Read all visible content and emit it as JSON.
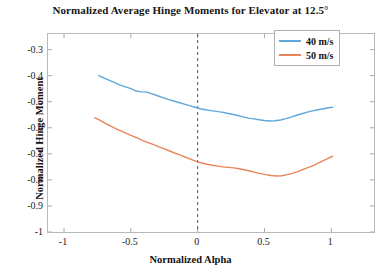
{
  "chart_data": {
    "type": "line",
    "title": "Normalized Average Hinge Moments for Elevator at 12.5°",
    "xlabel": "Normalized Alpha",
    "ylabel": "Normalized Hinge Moment",
    "xlim": [
      -1.12,
      1.32
    ],
    "ylim": [
      -1.0,
      -0.24
    ],
    "xticks": [
      -1,
      -0.5,
      0,
      0.5,
      1
    ],
    "xtick_labels": [
      "-1",
      "-0.5",
      "0",
      "0.5",
      "1"
    ],
    "yticks": [
      -0.3,
      -0.4,
      -0.5,
      -0.6,
      -0.7,
      -0.8,
      -0.9,
      -1
    ],
    "ytick_labels": [
      "-0.3",
      "-0.4",
      "-0.5",
      "-0.6",
      "-0.7",
      "-0.8",
      "-0.9",
      "-1"
    ],
    "grid": false,
    "legend_position": "top-right",
    "annotations": [
      {
        "type": "vline",
        "x": 0,
        "style": "dashed",
        "color": "#555555"
      }
    ],
    "series": [
      {
        "name": "40 m/s",
        "color": "#5fa8db",
        "x": [
          -0.74,
          -0.7,
          -0.66,
          -0.62,
          -0.58,
          -0.54,
          -0.5,
          -0.46,
          -0.42,
          -0.38,
          -0.34,
          -0.3,
          -0.26,
          -0.22,
          -0.18,
          -0.14,
          -0.1,
          -0.06,
          -0.02,
          0.02,
          0.06,
          0.1,
          0.14,
          0.18,
          0.22,
          0.26,
          0.3,
          0.34,
          0.38,
          0.42,
          0.46,
          0.5,
          0.54,
          0.58,
          0.62,
          0.66,
          0.7,
          0.74,
          0.78,
          0.82,
          0.86,
          0.9,
          0.94,
          0.98,
          1.01
        ],
        "y": [
          -0.4,
          -0.409,
          -0.418,
          -0.427,
          -0.436,
          -0.443,
          -0.45,
          -0.459,
          -0.462,
          -0.463,
          -0.47,
          -0.477,
          -0.484,
          -0.491,
          -0.497,
          -0.503,
          -0.509,
          -0.515,
          -0.521,
          -0.527,
          -0.531,
          -0.534,
          -0.537,
          -0.54,
          -0.544,
          -0.548,
          -0.553,
          -0.558,
          -0.563,
          -0.566,
          -0.569,
          -0.572,
          -0.574,
          -0.573,
          -0.57,
          -0.565,
          -0.559,
          -0.552,
          -0.546,
          -0.54,
          -0.535,
          -0.531,
          -0.527,
          -0.523,
          -0.521
        ]
      },
      {
        "name": "50 m/s",
        "color": "#e8855a",
        "x": [
          -0.77,
          -0.73,
          -0.69,
          -0.65,
          -0.61,
          -0.57,
          -0.53,
          -0.49,
          -0.45,
          -0.41,
          -0.37,
          -0.33,
          -0.29,
          -0.25,
          -0.21,
          -0.17,
          -0.13,
          -0.09,
          -0.05,
          -0.01,
          0.03,
          0.07,
          0.11,
          0.15,
          0.19,
          0.23,
          0.27,
          0.31,
          0.35,
          0.39,
          0.43,
          0.47,
          0.51,
          0.55,
          0.59,
          0.63,
          0.67,
          0.71,
          0.75,
          0.79,
          0.83,
          0.87,
          0.91,
          0.95,
          0.99,
          1.01
        ],
        "y": [
          -0.561,
          -0.572,
          -0.583,
          -0.594,
          -0.604,
          -0.613,
          -0.622,
          -0.631,
          -0.64,
          -0.649,
          -0.657,
          -0.665,
          -0.673,
          -0.681,
          -0.689,
          -0.697,
          -0.705,
          -0.713,
          -0.721,
          -0.729,
          -0.735,
          -0.74,
          -0.744,
          -0.747,
          -0.75,
          -0.752,
          -0.754,
          -0.757,
          -0.761,
          -0.766,
          -0.771,
          -0.776,
          -0.78,
          -0.783,
          -0.785,
          -0.784,
          -0.78,
          -0.775,
          -0.768,
          -0.76,
          -0.752,
          -0.744,
          -0.734,
          -0.724,
          -0.714,
          -0.71
        ]
      }
    ]
  },
  "legend": {
    "entries": [
      {
        "label": "40 m/s",
        "color": "#5fa8db"
      },
      {
        "label": "50 m/s",
        "color": "#e8855a"
      }
    ]
  }
}
